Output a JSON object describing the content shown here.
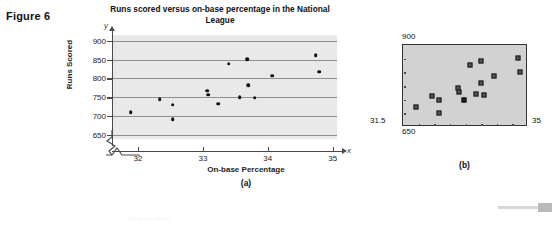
{
  "figure": {
    "label": "Figure 6"
  },
  "panel_a": {
    "caption": "(a)",
    "y_axis_letter": "y",
    "x_axis_letter": "x"
  },
  "panel_b": {
    "caption": "(b)",
    "label_top": "900",
    "label_bottom": "650",
    "label_left": "31.5",
    "label_right": "35"
  },
  "footer": {
    "faint_text": "Scatter Plot"
  },
  "chart_data": {
    "type": "scatter",
    "title": "Runs scored versus on-base percentage in the National League",
    "xlabel": "On-base Percentage",
    "ylabel": "Runs Scored",
    "xlim": [
      31.5,
      35
    ],
    "ylim": [
      640,
      915
    ],
    "xticks": [
      32,
      33,
      34,
      35
    ],
    "yticks": [
      650,
      700,
      750,
      800,
      850,
      900
    ],
    "grid": true,
    "axis_break": true,
    "legend": "none",
    "x": [
      31.87,
      32.32,
      32.52,
      32.52,
      33.05,
      33.07,
      33.22,
      33.38,
      33.55,
      33.67,
      33.68,
      33.78,
      34.05,
      34.72,
      34.78
    ],
    "y": [
      711,
      746,
      731,
      693,
      768,
      757,
      733,
      839,
      750,
      851,
      783,
      749,
      807,
      861,
      818
    ]
  }
}
